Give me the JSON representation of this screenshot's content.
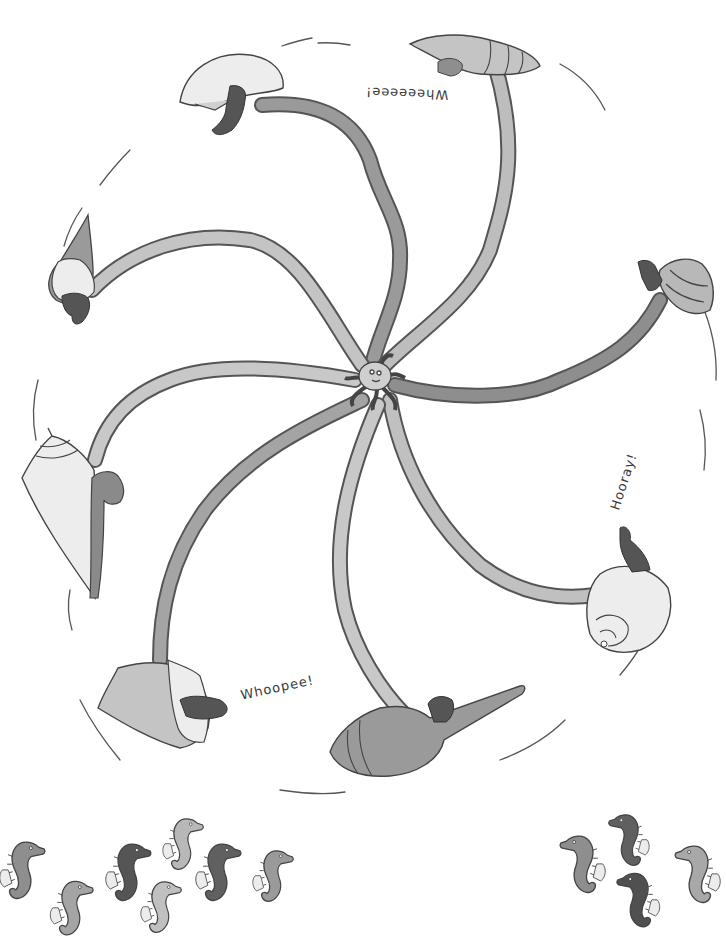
{
  "illustration": {
    "style": "grayscale hand-drawn children's book illustration",
    "colors": {
      "background": "#ffffff",
      "outline": "#444444",
      "tentacle_light": "#c8c8c8",
      "tentacle_mid": "#a8a8a8",
      "tentacle_dark": "#8a8a8a",
      "shell_light": "#ededed",
      "shell_mid": "#c4c4c4",
      "shell_dark": "#9a9a9a",
      "seahorse_light": "#b8b8b8",
      "seahorse_mid": "#8e8e8e",
      "seahorse_dark": "#555555"
    },
    "center": {
      "name": "octopus",
      "x": 375,
      "y": 380
    },
    "labels": [
      {
        "id": "wheeeeee",
        "text": "Wheeeeee!",
        "x": 365,
        "y": 92,
        "rotation": 182
      },
      {
        "id": "hooray",
        "text": "Hooray!",
        "x": 600,
        "y": 480,
        "rotation": -72
      },
      {
        "id": "whoopee",
        "text": "Whoopee!",
        "x": 240,
        "y": 685,
        "rotation": -12
      }
    ],
    "rides": [
      {
        "id": "shell-top-left",
        "shell": "white helmet shell",
        "rider": "dark seahorse"
      },
      {
        "id": "shell-top-right",
        "shell": "horn conch",
        "rider": "grey seahorse"
      },
      {
        "id": "shell-left-upper",
        "shell": "spire whelk",
        "rider": "dark seahorse"
      },
      {
        "id": "shell-right-upper",
        "shell": "turban shell",
        "rider": "dark seahorse"
      },
      {
        "id": "shell-left-middle",
        "shell": "cone whelk",
        "rider": "dark seahorse"
      },
      {
        "id": "shell-right-lower",
        "shell": "snail shell",
        "rider": "dark seahorse"
      },
      {
        "id": "shell-bottom-left",
        "shell": "ruffled murex",
        "rider": "dark seahorse"
      },
      {
        "id": "shell-bottom-center",
        "shell": "spindle shell",
        "rider": "dark seahorse"
      }
    ],
    "waiting_seahorses": {
      "left_group_count": 8,
      "right_group_count": 4
    }
  }
}
